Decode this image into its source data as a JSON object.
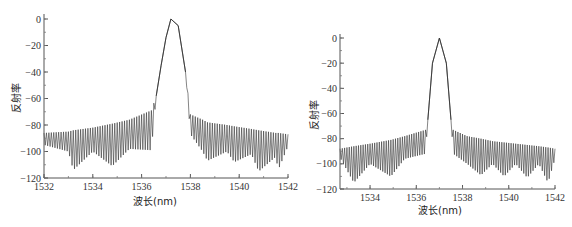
{
  "chart_data": [
    {
      "type": "line",
      "title": "",
      "xlabel": "波长(nm)",
      "ylabel": "反射率",
      "xlim": [
        1532,
        1542
      ],
      "ylim": [
        -120,
        0
      ],
      "xticks": [
        "1532",
        "1534",
        "1536",
        "1538",
        "1540",
        "1542"
      ],
      "yticks": [
        "0",
        "-20",
        "-40",
        "-60",
        "-80",
        "-100",
        "-120"
      ],
      "grid": false,
      "series": [
        {
          "name": "reflectance",
          "description": "Main reflection peak near 0 dB centered ~1537.2 nm with asymmetric side shoulders (~-14, -35, -58 on left edge); dense sidelobe oscillations between about -70 and -115 dB with envelope minima near 1533.2, 1534.8, 1538.7, 1539.8, 1540.8, 1541.6 nm",
          "x": [
            1532,
            1533,
            1533.2,
            1534,
            1534.8,
            1535.5,
            1536.4,
            1536.6,
            1536.8,
            1537.0,
            1537.2,
            1537.5,
            1537.8,
            1538.0,
            1538.5,
            1538.7,
            1539.5,
            1539.8,
            1540.5,
            1540.8,
            1541.5,
            1541.6,
            1542
          ],
          "upper_envelope": [
            -86,
            -85,
            -84,
            -82,
            -79,
            -76,
            -69,
            -58,
            -35,
            -14,
            0,
            -5,
            -40,
            -72,
            -76,
            -78,
            -80,
            -81,
            -83,
            -84,
            -86,
            -86,
            -87
          ],
          "lower_envelope": [
            -95,
            -100,
            -114,
            -100,
            -111,
            -98,
            -99,
            -58,
            -35,
            -14,
            0,
            -5,
            -40,
            -87,
            -100,
            -107,
            -100,
            -108,
            -102,
            -115,
            -104,
            -114,
            -96
          ]
        }
      ]
    },
    {
      "type": "line",
      "title": "",
      "xlabel": "波长(nm)",
      "ylabel": "反射率",
      "xlim": [
        1532.7,
        1542
      ],
      "ylim": [
        -120,
        0
      ],
      "xticks": [
        "1534",
        "1536",
        "1538",
        "1540",
        "1542"
      ],
      "yticks": [
        "0",
        "-20",
        "-40",
        "-60",
        "-80",
        "-100",
        "-120"
      ],
      "grid": false,
      "series": [
        {
          "name": "reflectance",
          "description": "Symmetric apodized reflection peak near 0 dB centered ~1537.0 nm, steep sides reaching ~-65 dB at 1536.5 and 1537.5 nm; sidelobes oscillating between about -72 and -115 dB with envelope minima near 1533.3, 1534.9, 1538.8, 1539.8, 1540.8, 1541.7 nm",
          "x": [
            1532.7,
            1533.3,
            1534,
            1534.9,
            1535.5,
            1536.4,
            1536.5,
            1536.7,
            1537.0,
            1537.3,
            1537.5,
            1537.6,
            1538.2,
            1538.8,
            1539.3,
            1539.8,
            1540.3,
            1540.8,
            1541.3,
            1541.7,
            1542
          ],
          "upper_envelope": [
            -88,
            -86,
            -84,
            -81,
            -78,
            -73,
            -65,
            -20,
            0,
            -20,
            -65,
            -73,
            -78,
            -80,
            -82,
            -83,
            -84,
            -85,
            -86,
            -87,
            -88
          ],
          "lower_envelope": [
            -95,
            -115,
            -100,
            -110,
            -96,
            -92,
            -65,
            -20,
            0,
            -20,
            -65,
            -92,
            -100,
            -109,
            -100,
            -110,
            -100,
            -111,
            -100,
            -115,
            -96
          ]
        }
      ]
    }
  ],
  "charts": {
    "left": {
      "ylabel": "反射率",
      "xlabel": "波长(nm)",
      "xticks": [
        "1532",
        "1534",
        "1536",
        "1538",
        "1540",
        "1542"
      ],
      "yticks": [
        "0",
        "-20",
        "-40",
        "-60",
        "-80",
        "-100",
        "-120"
      ]
    },
    "right": {
      "ylabel": "反射率",
      "xlabel": "波长(nm)",
      "xticks": [
        "1534",
        "1536",
        "1538",
        "1540",
        "1542"
      ],
      "yticks": [
        "0",
        "-20",
        "-40",
        "-60",
        "-80",
        "-100",
        "-120"
      ]
    },
    "line_color": "#333333",
    "axis_color": "#555555"
  }
}
